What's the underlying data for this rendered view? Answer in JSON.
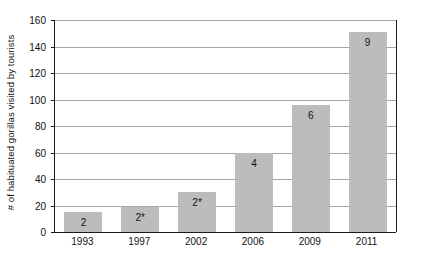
{
  "chart_data": {
    "type": "bar",
    "title": "",
    "subtitle": "",
    "xlabel": "",
    "ylabel": "# of habituated gorillas visited by tourists",
    "categories": [
      "1993",
      "1997",
      "2002",
      "2006",
      "2009",
      "2011"
    ],
    "values": [
      15,
      19,
      30,
      60,
      96,
      151
    ],
    "point_labels": [
      "2",
      "2*",
      "2*",
      "4",
      "6",
      "9"
    ],
    "ylim": [
      0,
      160
    ],
    "y_ticks": [
      0,
      20,
      40,
      60,
      80,
      100,
      120,
      140,
      160
    ],
    "y_tick_labels": [
      "0",
      "20",
      "40",
      "60",
      "80",
      "100",
      "120",
      "140",
      "160"
    ],
    "grid": "horizontal",
    "legend": "none",
    "series": [
      {
        "name": "# of habituated gorillas visited by tourists",
        "values": [
          15,
          19,
          30,
          60,
          96,
          151
        ],
        "labels": [
          "2",
          "2*",
          "2*",
          "4",
          "6",
          "9"
        ],
        "color": "#bcbcbc"
      }
    ],
    "colors": {
      "bar_fill": "#bcbcbc",
      "gridline": "#a6a6a6",
      "axis_line": "#1a1a1a",
      "text": "#111111",
      "background": "#ffffff"
    }
  }
}
